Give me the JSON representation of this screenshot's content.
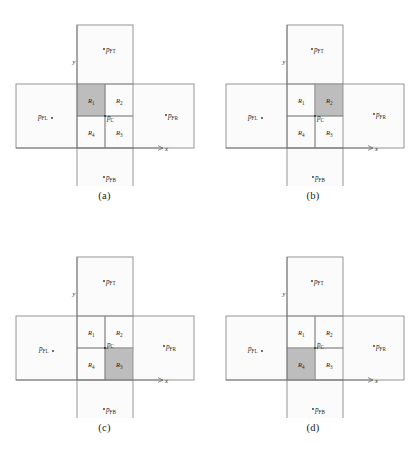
{
  "figure": {
    "type": "diagram",
    "panel_count": 4
  },
  "labels": {
    "center_point": "p",
    "center_point_sub": "C",
    "far_top": "p",
    "far_top_sub": "FT",
    "far_bottom": "p",
    "far_bottom_sub": "FB",
    "far_left": "p",
    "far_left_sub": "FL",
    "far_right": "p",
    "far_right_sub": "FR",
    "axis_x": "x",
    "axis_y": "y",
    "region_1": "R",
    "region_1_sub": "1",
    "region_2": "R",
    "region_2_sub": "2",
    "region_3": "R",
    "region_3_sub": "3",
    "region_4": "R",
    "region_4_sub": "4"
  },
  "colors": {
    "shaded_fill": "#b9b9b9",
    "rect_fill": "#fafafa",
    "stroke": "#8a8a8a",
    "text": "#1f1f1f",
    "background": "#ffffff"
  },
  "panels": [
    {
      "id": "a",
      "caption": "(a)",
      "shaded_region": "R1",
      "shaded_quadrant": "top-left"
    },
    {
      "id": "b",
      "caption": "(b)",
      "shaded_region": "R2",
      "shaded_quadrant": "top-right"
    },
    {
      "id": "c",
      "caption": "(c)",
      "shaded_region": "R3",
      "shaded_quadrant": "bottom-right"
    },
    {
      "id": "d",
      "caption": "(d)",
      "shaded_region": "R4",
      "shaded_quadrant": "bottom-left"
    }
  ]
}
